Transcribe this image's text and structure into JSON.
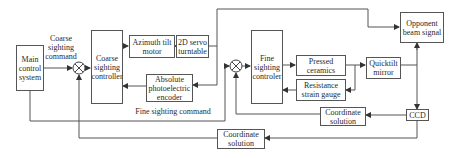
{
  "diagram": {
    "type": "block-diagram",
    "blocks": {
      "main_control": "Main control system",
      "coarse_controller": "Coarse sighting controller",
      "azimuth_motor": "Azimuth tilt motor",
      "servo_turntable": "2D servo turntable",
      "encoder": "Absolute photoelectric encoder",
      "fine_controller": "Fine sighting controler",
      "pressed_ceramics": "Pressed ceramics",
      "strain_gauge": "Resistance strain gauge",
      "quicktilt_mirror": "Quicktilt mirror",
      "opponent_beam": "Opponent beam signal",
      "ccd": "CCD",
      "coord_solution_right": "Coordinate solution",
      "coord_solution_bottom": "Coordinate solution"
    },
    "labels": {
      "coarse_command": "Coarse sighting command",
      "fine_command": "Fine sighting command"
    },
    "summing_junctions": 2,
    "line_color": "#555555"
  }
}
